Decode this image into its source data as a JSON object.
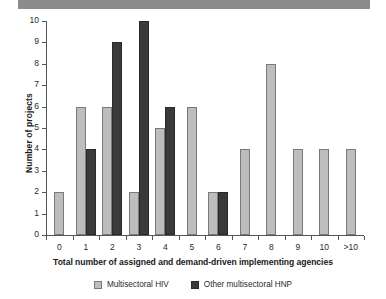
{
  "banner": {
    "name": "top-gray-banner",
    "color": "#8c8c8c"
  },
  "chart_data": {
    "type": "bar",
    "title": "",
    "xlabel": "Total number of assigned and demand-driven implementing agencies",
    "ylabel": "Number of projects",
    "categories": [
      "0",
      "1",
      "2",
      "3",
      "4",
      "5",
      "6",
      "7",
      "8",
      "9",
      "10",
      ">10"
    ],
    "series": [
      {
        "name": "Multisectoral HIV",
        "color": "#bdbdbd",
        "values": [
          2,
          6,
          6,
          2,
          5,
          6,
          2,
          4,
          8,
          4,
          4,
          4
        ]
      },
      {
        "name": "Other multisectoral HNP",
        "color": "#3a3a3a",
        "values": [
          0,
          4,
          9,
          10,
          6,
          0,
          2,
          0,
          0,
          0,
          0,
          0
        ]
      }
    ],
    "ylim": [
      0,
      10
    ],
    "yticks": [
      "0",
      "1",
      "2",
      "3",
      "4",
      "5",
      "6",
      "7",
      "8",
      "9",
      "10"
    ],
    "grid": false,
    "legend_position": "bottom-center"
  },
  "legend": {
    "items": [
      {
        "label": "Multisectoral HIV",
        "color": "#bdbdbd"
      },
      {
        "label": "Other multisectoral HNP",
        "color": "#3a3a3a"
      }
    ]
  }
}
